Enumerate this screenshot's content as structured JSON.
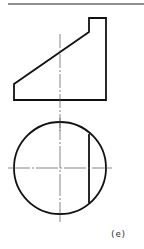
{
  "figure": {
    "label": "(e)",
    "views": [
      "front-view-trapezoid-with-notch",
      "top-view-circle-with-chord"
    ],
    "line_color": "#111111",
    "centerline_color": "#555555"
  }
}
